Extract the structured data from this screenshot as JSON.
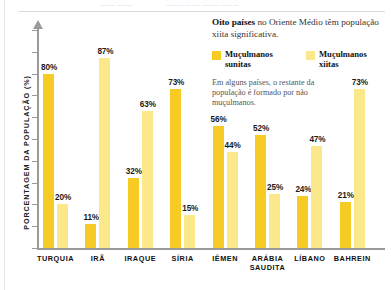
{
  "top_strip": {
    "fragment_left": "....... ........",
    "fragment_right": "........ ....... ........ ........."
  },
  "annotation": {
    "headline_bold": "Oito países",
    "headline_rest": " no Oriente Médio têm população xiita significativa.",
    "note": "Em alguns países, o restante da população é formado por não muçulmanos."
  },
  "legend": {
    "items": [
      {
        "label": "Muçulmanos sunitas",
        "color": "#F6CB24",
        "key": "sunni"
      },
      {
        "label": "Muçulmanos xiitas",
        "color": "#FBE88B",
        "key": "shia"
      }
    ]
  },
  "axis": {
    "ylabel": "PORCENTAGEM DA POPULAÇÃO (%)"
  },
  "chart_data": {
    "type": "bar",
    "title": "Oito países no Oriente Médio têm população xiita significativa.",
    "subtitle": "Em alguns países, o restante da população é formado por não muçulmanos.",
    "xlabel": "",
    "ylabel": "PORCENTAGEM DA POPULAÇÃO (%)",
    "ylim": [
      0,
      100
    ],
    "grid": false,
    "legend_position": "top-right",
    "categories": [
      "TURQUIA",
      "IRÃ",
      "IRAQUE",
      "SÍRIA",
      "IÊMEN",
      "ARÁBIA\nSAUDITA",
      "LÍBANO",
      "BAHREIN"
    ],
    "series": [
      {
        "name": "Muçulmanos sunitas",
        "color": "#F6CB24",
        "values": [
          80,
          11,
          32,
          73,
          56,
          52,
          24,
          21
        ],
        "labels": [
          "80%",
          "11%",
          "32%",
          "73%",
          "56%",
          "52%",
          "24%",
          "21%"
        ]
      },
      {
        "name": "Muçulmanos xiitas",
        "color": "#FBE88B",
        "values": [
          20,
          87,
          63,
          15,
          44,
          25,
          47,
          73
        ],
        "labels": [
          "20%",
          "87%",
          "63%",
          "15%",
          "44%",
          "25%",
          "47%",
          "73%"
        ]
      }
    ]
  }
}
